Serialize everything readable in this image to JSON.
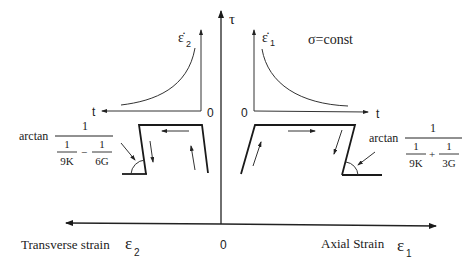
{
  "diagram": {
    "axes": {
      "vertical_label": "τ",
      "origin_label": "0",
      "left_axis_label": "Transverse strain",
      "left_axis_symbol": "ε",
      "left_axis_subscript": "2",
      "right_axis_label": "Axial Strain",
      "right_axis_symbol": "ε",
      "right_axis_subscript": "1"
    },
    "left_inset": {
      "y_symbol": "ε̇",
      "y_subscript": "2",
      "x_label": "t",
      "origin_label": "0",
      "curve": "increasing creep rate vs time"
    },
    "right_inset": {
      "y_symbol": "ε̇",
      "y_subscript": "1",
      "x_label": "t",
      "origin_label": "0",
      "condition": "σ=const",
      "curve": "decreasing creep rate vs time"
    },
    "left_annotation": {
      "prefix": "arctan",
      "numerator": "1",
      "den_term1_num": "1",
      "den_term1_den": "9K",
      "operator": "−",
      "den_term2_num": "1",
      "den_term2_den": "6G"
    },
    "right_annotation": {
      "prefix": "arctan",
      "numerator": "1",
      "den_term1_num": "1",
      "den_term1_den": "9K",
      "operator": "+",
      "den_term2_num": "1",
      "den_term2_den": "3G"
    }
  }
}
